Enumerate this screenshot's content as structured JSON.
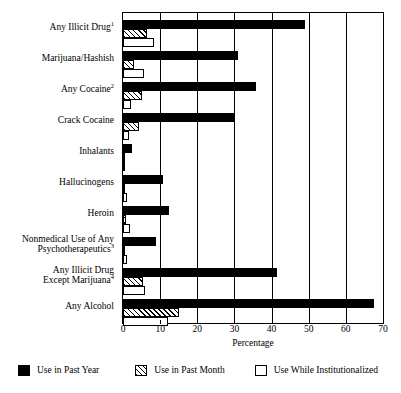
{
  "chart_data": {
    "type": "bar",
    "orientation": "horizontal",
    "title": "",
    "xlabel": "Percentage",
    "ylabel": "",
    "xlim": [
      0,
      70
    ],
    "xticks": [
      0,
      10,
      20,
      30,
      40,
      50,
      60,
      70
    ],
    "grid": true,
    "legend_position": "bottom",
    "categories": [
      "Any Illicit Drug¹",
      "Marijuana/Hashish",
      "Any Cocaine²",
      "Crack Cocaine",
      "Inhalants",
      "Hallucinogens",
      "Heroin",
      "Nonmedical Use of Any Psychotherapeutics³",
      "Any Illicit Drug Except Marijuana⁴",
      "Any Alcohol"
    ],
    "category_lines": [
      [
        "Any Illicit Drug",
        "1"
      ],
      [
        "Marijuana/Hashish",
        ""
      ],
      [
        "Any Cocaine",
        "2"
      ],
      [
        "Crack Cocaine",
        ""
      ],
      [
        "Inhalants",
        ""
      ],
      [
        "Hallucinogens",
        ""
      ],
      [
        "Heroin",
        ""
      ],
      [
        "Nonmedical Use of Any|Psychotherapeutics",
        "3"
      ],
      [
        "Any Illicit Drug|Except Marijuana",
        "4"
      ],
      [
        "Any Alcohol",
        ""
      ]
    ],
    "series": [
      {
        "name": "Use in Past Year",
        "style": "solid-black",
        "color": "#000000",
        "values": [
          49.0,
          31.0,
          35.8,
          29.8,
          2.5,
          10.8,
          12.3,
          8.9,
          41.5,
          67.5
        ]
      },
      {
        "name": "Use in Past Month",
        "style": "hatched",
        "color": "#000000",
        "values": [
          6.4,
          3.0,
          5.1,
          4.3,
          0.3,
          0.6,
          0.7,
          0.5,
          5.4,
          15.0
        ]
      },
      {
        "name": "Use While Institutionalized",
        "style": "open-white",
        "color": "#ffffff",
        "values": [
          8.4,
          5.6,
          2.2,
          1.5,
          0.2,
          1.0,
          1.8,
          1.2,
          5.8,
          12.0
        ]
      }
    ]
  },
  "legend": {
    "items": [
      {
        "label": "Use in Past Year",
        "swatch": "solid-black-swatch"
      },
      {
        "label": "Use in Past Month",
        "swatch": "hatched-swatch"
      },
      {
        "label": "Use While Institutionalized",
        "swatch": "open-white-swatch"
      }
    ]
  },
  "axis": {
    "x_title": "Percentage",
    "x_tick_labels": [
      "0",
      "10",
      "20",
      "30",
      "40",
      "50",
      "60",
      "70"
    ]
  }
}
